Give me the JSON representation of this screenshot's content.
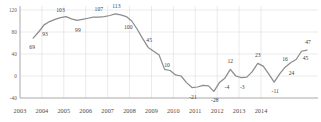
{
  "chart_data": {
    "type": "line",
    "title": "",
    "xlabel": "",
    "ylabel": "",
    "ylim": [
      -40,
      120
    ],
    "xlim": [
      2003,
      2014.75
    ],
    "grid": true,
    "legend": false,
    "line_color": "#8c8c8c",
    "grid_color": "#d4d4d4",
    "axis_color": "#9a9a9a",
    "y_ticks": [
      120,
      80,
      40,
      0,
      -40
    ],
    "y_tick_labels": [
      "120",
      "80",
      "40",
      "0",
      "-40"
    ],
    "x_ticks": [
      2003,
      2004,
      2005,
      2006,
      2007,
      2008,
      2009,
      2010,
      2011,
      2012,
      2013,
      2014
    ],
    "x_tick_labels": [
      "2003",
      "2004",
      "2005",
      "2006",
      "2007",
      "2008",
      "2009",
      "2010",
      "2011",
      "2012",
      "2013",
      "2014"
    ],
    "x": [
      2003.6,
      2003.85,
      2004.1,
      2004.35,
      2004.6,
      2004.85,
      2005.1,
      2005.35,
      2005.6,
      2005.85,
      2006.1,
      2006.35,
      2006.6,
      2006.85,
      2007.1,
      2007.35,
      2007.6,
      2007.85,
      2008.1,
      2008.35,
      2008.6,
      2008.85,
      2009.1,
      2009.35,
      2009.6,
      2009.85,
      2010.1,
      2010.35,
      2010.6,
      2010.85,
      2011.1,
      2011.35,
      2011.6,
      2011.85,
      2012.1,
      2012.35,
      2012.6,
      2012.85,
      2013.1,
      2013.35,
      2013.6,
      2013.85,
      2014.1,
      2014.35,
      2014.6
    ],
    "values": [
      69,
      80,
      93,
      99,
      103,
      106,
      108,
      104,
      101,
      103,
      105,
      107,
      107,
      108,
      110,
      113,
      111,
      108,
      100,
      85,
      68,
      52,
      45,
      38,
      12,
      10,
      2,
      0,
      -12,
      -21,
      -20,
      -17,
      -18,
      -28,
      -12,
      -4,
      12,
      0,
      -3,
      -2,
      8,
      23,
      18,
      4,
      -11
    ],
    "labeled_points": [
      {
        "x": 2003.6,
        "y": 69,
        "label": "69",
        "dx": -1,
        "dy": 9
      },
      {
        "x": 2004.1,
        "y": 93,
        "label": "93",
        "dx": 1,
        "dy": 9
      },
      {
        "x": 2004.85,
        "y": 106,
        "label": "103",
        "dx": 0,
        "dy": -8
      },
      {
        "x": 2005.6,
        "y": 101,
        "label": "99",
        "dx": 1,
        "dy": 10
      },
      {
        "x": 2006.6,
        "y": 107,
        "label": "107",
        "dx": 0,
        "dy": -8
      },
      {
        "x": 2007.35,
        "y": 113,
        "label": "113",
        "dx": 1,
        "dy": -8
      },
      {
        "x": 2007.85,
        "y": 108,
        "label": "100",
        "dx": 2,
        "dy": 10
      },
      {
        "x": 2008.85,
        "y": 52,
        "label": "45",
        "dx": 1,
        "dy": -7
      },
      {
        "x": 2009.85,
        "y": 10,
        "label": "10",
        "dx": -3,
        "dy": -6
      },
      {
        "x": 2010.85,
        "y": -21,
        "label": "-21",
        "dx": 1,
        "dy": 9
      },
      {
        "x": 2011.85,
        "y": -28,
        "label": "-28",
        "dx": 1,
        "dy": 9
      },
      {
        "x": 2012.35,
        "y": -4,
        "label": "-4",
        "dx": 2,
        "dy": 9
      },
      {
        "x": 2012.6,
        "y": 12,
        "label": "12",
        "dx": 0,
        "dy": -8
      },
      {
        "x": 2013.1,
        "y": -3,
        "label": "-3",
        "dx": 1,
        "dy": 9
      },
      {
        "x": 2013.85,
        "y": 23,
        "label": "23",
        "dx": 0,
        "dy": -8
      },
      {
        "x": 2014.6,
        "y": -11,
        "label": "-11",
        "dx": 1,
        "dy": 9
      },
      {
        "x": 2015.1,
        "y": 16,
        "label": "16",
        "dx": 0,
        "dy": -8
      },
      {
        "x": 2015.35,
        "y": 24,
        "label": "24",
        "dx": 1,
        "dy": 10
      },
      {
        "x": 2015.85,
        "y": 45,
        "label": "45",
        "dx": 4,
        "dy": 7
      },
      {
        "x": 2016.1,
        "y": 47,
        "label": "47",
        "dx": 1,
        "dy": -8
      }
    ],
    "tail_x": [
      2014.85,
      2015.1,
      2015.35,
      2015.6,
      2015.85,
      2016.1
    ],
    "tail_values": [
      4,
      16,
      24,
      30,
      45,
      47
    ]
  }
}
